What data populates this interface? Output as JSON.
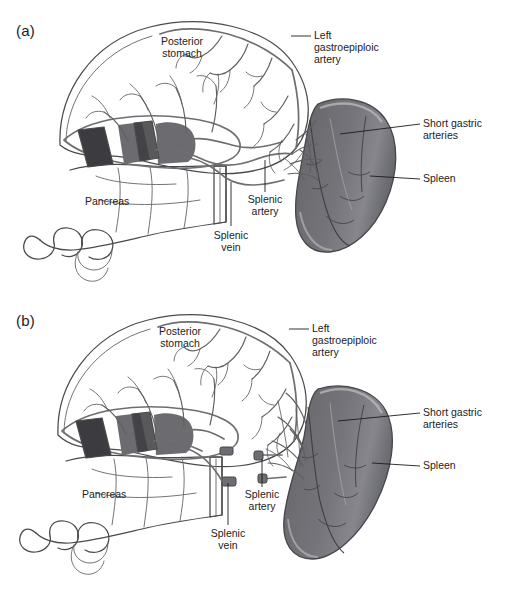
{
  "figure": {
    "panels": [
      {
        "id": "a",
        "letter": "(a)",
        "description": "Splenic artery and vein intact, coursing along the superior border of the pancreas to the splenic hilum",
        "labels": [
          {
            "name": "posterior-stomach",
            "text": "Posterior\nstomach"
          },
          {
            "name": "left-gastroepiploic-artery",
            "text": "Left\ngastroepiploic\nartery"
          },
          {
            "name": "short-gastric-arteries",
            "text": "Short gastric\narteries"
          },
          {
            "name": "spleen",
            "text": "Spleen"
          },
          {
            "name": "splenic-artery",
            "text": "Splenic\nartery"
          },
          {
            "name": "splenic-vein",
            "text": "Splenic\nvein"
          },
          {
            "name": "pancreas",
            "text": "Pancreas"
          }
        ]
      },
      {
        "id": "b",
        "letter": "(b)",
        "description": "Splenic artery and vein divided, showing ligated stumps at the pancreatic tail",
        "labels": [
          {
            "name": "posterior-stomach",
            "text": "Posterior\nstomach"
          },
          {
            "name": "left-gastroepiploic-artery",
            "text": "Left\ngastroepiploic\nartery"
          },
          {
            "name": "short-gastric-arteries",
            "text": "Short gastric\narteries"
          },
          {
            "name": "spleen",
            "text": "Spleen"
          },
          {
            "name": "splenic-artery",
            "text": "Splenic\nartery"
          },
          {
            "name": "splenic-vein",
            "text": "Splenic\nvein"
          },
          {
            "name": "pancreas",
            "text": "Pancreas"
          }
        ]
      }
    ]
  },
  "colors": {
    "background": "#ffffff",
    "ink": "#1c1c1c",
    "stomach_fill": "#ececed",
    "pancreas_fill": "#f2f2f2",
    "spleen_dark": "#5d5d61",
    "spleen_mid": "#7b7b80",
    "spleen_light": "#9a9a9f",
    "vessel": "#6e6e70",
    "cut_stump_dark": "#3c3c40",
    "outline": "#4a4a4c"
  }
}
